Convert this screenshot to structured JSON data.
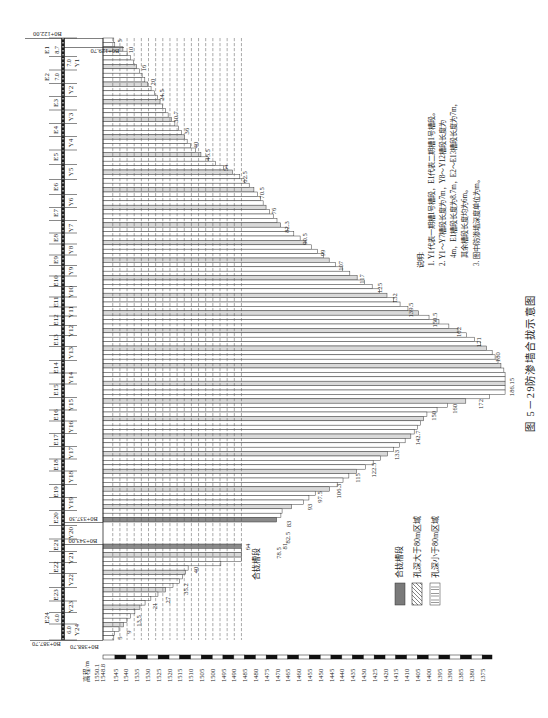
{
  "figure": {
    "number": "图 5－29",
    "title": "防渗墙合拢示意图"
  },
  "notes": {
    "heading": "说明:",
    "lines": [
      "1. Y1代表一期槽1号槽段，E1代表二期槽1号槽段。",
      "2. Y1～Y7槽段长度为7m，Y8～Y12槽段长度为",
      "4m，E1槽段长度为8.7m，E2～E13槽段长度为7m，",
      "其余槽段长度均为6m。",
      "3. 图中防渗墙深度单位为m。"
    ]
  },
  "legend": {
    "items": [
      {
        "label": "合拢槽段",
        "pattern": "solid-gray"
      },
      {
        "label": "孔深大于80m区域",
        "pattern": "diagonal-hatch"
      },
      {
        "label": "孔深小于80m区域",
        "pattern": "horizontal-lines"
      }
    ]
  },
  "colors": {
    "line": "#3a3a3a",
    "band_fill": "#d9d9d9",
    "closure_fill": "#8a8a8a",
    "legend_gray": "#7a7a7a",
    "grid": "#555555"
  },
  "closure_annotation": "合拢槽段",
  "elevation_axis": {
    "title": "高程/m",
    "ticks": [
      "1550.1",
      "1548.8",
      "1545",
      "1540",
      "1535",
      "1530",
      "1525",
      "1520",
      "1515",
      "1510",
      "1505",
      "1500",
      "1495",
      "1490",
      "1485",
      "1480",
      "1475",
      "1470",
      "1465",
      "1460",
      "1455",
      "1450",
      "1445",
      "1440",
      "1435",
      "1430",
      "1425",
      "1420",
      "1415",
      "1410",
      "1405",
      "1400",
      "1395",
      "1390",
      "1385",
      "1380",
      "1375"
    ]
  },
  "station_marks": [
    {
      "label": "B0+122.00"
    },
    {
      "label": "B0+129.70"
    },
    {
      "label": "B0+337.30"
    },
    {
      "label": "B0+343.00"
    },
    {
      "label": "B0+387.70"
    },
    {
      "label": "B0+388.70"
    }
  ],
  "slots": {
    "phase2": [
      {
        "name": "E1",
        "dim": "8.7"
      },
      {
        "name": "E2",
        "dim": "7.0"
      },
      {
        "name": "E3"
      },
      {
        "name": "E4"
      },
      {
        "name": "E5"
      },
      {
        "name": "E6"
      },
      {
        "name": "E7"
      },
      {
        "name": "E8"
      },
      {
        "name": "E9"
      },
      {
        "name": "E10"
      },
      {
        "name": "E11"
      },
      {
        "name": "E12"
      },
      {
        "name": "E13"
      },
      {
        "name": "E14"
      },
      {
        "name": "E15"
      },
      {
        "name": "E16"
      },
      {
        "name": "E17"
      },
      {
        "name": "E18"
      },
      {
        "name": "E19"
      },
      {
        "name": "E20"
      },
      {
        "name": "E21"
      },
      {
        "name": "E22"
      },
      {
        "name": "E23"
      },
      {
        "name": "E24",
        "dim": "6.0"
      }
    ],
    "phase1": [
      {
        "name": "Y1",
        "dim": "7.0"
      },
      {
        "name": "Y2"
      },
      {
        "name": "Y3"
      },
      {
        "name": "Y4"
      },
      {
        "name": "Y5"
      },
      {
        "name": "Y6"
      },
      {
        "name": "Y7"
      },
      {
        "name": "Y8"
      },
      {
        "name": "Y9"
      },
      {
        "name": "Y10"
      },
      {
        "name": "Y11"
      },
      {
        "name": "Y12"
      },
      {
        "name": "Y13"
      },
      {
        "name": "Y14"
      },
      {
        "name": "Y15"
      },
      {
        "name": "Y16"
      },
      {
        "name": "Y17"
      },
      {
        "name": "Y18"
      },
      {
        "name": "Y19"
      },
      {
        "name": "Y20"
      },
      {
        "name": "Y21"
      },
      {
        "name": "Y22"
      },
      {
        "name": "Y23"
      },
      {
        "name": "Y24",
        "dim": "6.0"
      }
    ]
  },
  "chart_data": {
    "type": "bar",
    "orientation": "horizontal",
    "title": "防渗墙合拢示意图",
    "xlabel": "",
    "ylabel": "",
    "x_axis": "depth (m), starting at wall top elevation 1550.1",
    "y_axis": "chainage B0+122.00 to B0+388.70",
    "closure_gap": [
      "B0+337.30",
      "B0+343.00"
    ],
    "profile": {
      "upper": [
        [
          122.0,
          5
        ],
        [
          124.7,
          5
        ],
        [
          127.3,
          10
        ],
        [
          135.3,
          16
        ],
        [
          141.6,
          20
        ],
        [
          147.4,
          24.5
        ],
        [
          157.1,
          30.7
        ],
        [
          163.4,
          36
        ],
        [
          169.6,
          40
        ],
        [
          174.0,
          45.5
        ],
        [
          178.9,
          54
        ],
        [
          182.9,
          62.5
        ],
        [
          190.1,
          70.5
        ],
        [
          198.1,
          76
        ],
        [
          205.2,
          82.3
        ],
        [
          210.5,
          90.5
        ],
        [
          216.7,
          99
        ],
        [
          222.5,
          107
        ],
        [
          228.3,
          117
        ],
        [
          232.8,
          125
        ],
        [
          236.8,
          132
        ],
        [
          241.7,
          139.5
        ],
        [
          246.1,
          150.5
        ],
        [
          251.0,
          162
        ],
        [
          255.4,
          171
        ],
        [
          261.7,
          180
        ],
        [
          270.6,
          186.15
        ],
        [
          280.4,
          186.15
        ],
        [
          282.6,
          172
        ],
        [
          285.2,
          160
        ],
        [
          289.3,
          150
        ],
        [
          299.0,
          142.7
        ],
        [
          306.2,
          133
        ],
        [
          312.4,
          122.5
        ],
        [
          315.9,
          115
        ],
        [
          322.2,
          106.3
        ],
        [
          324.8,
          97.5
        ],
        [
          328.4,
          93
        ],
        [
          332.0,
          83
        ],
        [
          334.2,
          82.5
        ],
        [
          336.0,
          81
        ],
        [
          337.3,
          78.5
        ]
      ],
      "lower": [
        [
          343.0,
          64
        ],
        [
          351.6,
          64
        ],
        [
          353.5,
          40
        ],
        [
          361.1,
          35.2
        ],
        [
          365.9,
          27
        ],
        [
          369.7,
          21
        ],
        [
          376.3,
          13.5
        ],
        [
          382.0,
          9
        ],
        [
          385.8,
          5
        ],
        [
          388.7,
          5
        ]
      ]
    },
    "depth_labels": {
      "upper": [
        {
          "text": "5",
          "station": 123.3
        },
        {
          "text": "10",
          "station": 127.3
        },
        {
          "text": "16",
          "station": 135.3
        },
        {
          "text": "20",
          "station": 141.6
        },
        {
          "text": "24.5",
          "station": 147.4
        },
        {
          "text": "30.7",
          "station": 157.1
        },
        {
          "text": "36",
          "station": 163.4
        },
        {
          "text": "40",
          "station": 169.6
        },
        {
          "text": "45.5",
          "station": 174.0
        },
        {
          "text": "54",
          "station": 179.8
        },
        {
          "text": "62.5",
          "station": 183.8
        },
        {
          "text": "70.5",
          "station": 190.9
        },
        {
          "text": "76",
          "station": 199.0
        },
        {
          "text": "82.3",
          "station": 206.1
        },
        {
          "text": "90.5",
          "station": 211.4
        },
        {
          "text": "99",
          "station": 217.6
        },
        {
          "text": "107",
          "station": 223.4
        },
        {
          "text": "117",
          "station": 229.2
        },
        {
          "text": "125",
          "station": 233.2
        },
        {
          "text": "132",
          "station": 237.7
        },
        {
          "text": "139.5",
          "station": 243.0
        },
        {
          "text": "150.5",
          "station": 247.5
        },
        {
          "text": "162",
          "station": 252.8
        },
        {
          "text": "171",
          "station": 257.3
        },
        {
          "text": "180",
          "station": 264.0
        },
        {
          "text": "186.15",
          "station": 277.3
        },
        {
          "text": "172",
          "station": 284.8
        },
        {
          "text": "160",
          "station": 287.0
        },
        {
          "text": "150",
          "station": 290.1
        },
        {
          "text": "142.7",
          "station": 299.9
        },
        {
          "text": "133",
          "station": 307.5
        },
        {
          "text": "122.5",
          "station": 314.2
        },
        {
          "text": "115",
          "station": 317.7
        },
        {
          "text": "106.3",
          "station": 323.5
        },
        {
          "text": "97.5",
          "station": 326.2
        },
        {
          "text": "93",
          "station": 330.6
        },
        {
          "text": "83",
          "station": 337.8
        },
        {
          "text": "82.5",
          "station": 341.4
        },
        {
          "text": "81",
          "station": 344.0
        },
        {
          "text": "78.5",
          "station": 347.3
        }
      ],
      "lower": [
        {
          "text": "64",
          "station": 344.4
        },
        {
          "text": "40",
          "station": 355.4
        },
        {
          "text": "35.2",
          "station": 364.4
        },
        {
          "text": "27",
          "station": 369.7
        },
        {
          "text": "21",
          "station": 372.5
        },
        {
          "text": "13.5",
          "station": 379.7
        },
        {
          "text": "9",
          "station": 384.9
        },
        {
          "text": "5",
          "station": 387.8
        }
      ]
    }
  }
}
